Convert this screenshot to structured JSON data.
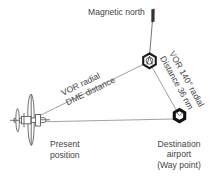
{
  "diagram": {
    "labels": {
      "magnetic_north": "Magnetic north",
      "vor_dme_line1": "VOR radial",
      "vor_dme_line2": "DME distance",
      "radial_line1": "VOR 140° radial",
      "radial_line2": "Distance 36 nm",
      "present_line1": "Present",
      "present_line2": "position",
      "destination_line1": "Destination",
      "destination_line2": "airport",
      "destination_line3": "(Way point)"
    },
    "icons": {
      "aircraft": "aircraft-top-view-icon",
      "vor_station": "vor-station-icon",
      "airport": "airport-symbol-icon",
      "north_arrow": "north-arrow-icon"
    },
    "values": {
      "radial_degrees": "140°",
      "distance": "36 nm"
    },
    "colors": {
      "line": "#777777",
      "symbol": "#111111",
      "text": "#444444",
      "background": "#ffffff"
    },
    "geometry": {
      "aircraft_point": "35,120",
      "vor_point": "150,60",
      "airport_point": "180,120",
      "north_arrow_tip": "155,9"
    }
  }
}
